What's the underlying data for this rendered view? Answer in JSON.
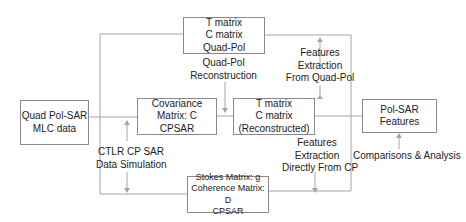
{
  "diagram": {
    "nodes": {
      "quadpol_matrix": {
        "lines": [
          "T matrix",
          "C matrix",
          "Quad-Pol"
        ]
      },
      "mlc_data": {
        "lines": [
          "Quad Pol-SAR",
          "MLC data"
        ]
      },
      "covariance": {
        "lines": [
          "Covariance",
          "Matrix: C",
          "CPSAR"
        ]
      },
      "reconstructed": {
        "lines": [
          "T matrix",
          "C matrix",
          "(Reconstructed)"
        ]
      },
      "features": {
        "lines": [
          "Pol-SAR",
          "Features"
        ]
      },
      "stokes": {
        "lines": [
          "Stokes Matrix: g",
          "Coherence Matrix: D",
          "CPSAR"
        ]
      }
    },
    "labels": {
      "reconstruction": [
        "Quad-Pol",
        "Reconstruction"
      ],
      "extraction_quadpol": [
        "Features",
        "Extraction",
        "From Quad-Pol"
      ],
      "simulation": [
        "CTLR CP SAR",
        "Data Simulation"
      ],
      "extraction_cp": [
        "Features",
        "Extraction",
        "Directly From CP"
      ],
      "comparison": [
        "Comparisons & Analysis"
      ]
    },
    "colors": {
      "line": "#a6a6a6",
      "box_border": "#8a8a8a",
      "text": "#222222"
    }
  }
}
